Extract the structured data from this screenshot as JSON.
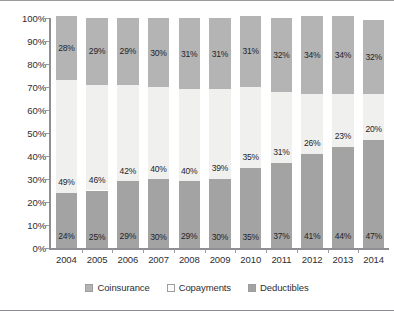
{
  "chart_data": {
    "type": "bar",
    "stacked": true,
    "stack_mode": "percent",
    "title": "",
    "subtitle": "",
    "xlabel": "",
    "ylabel": "",
    "grid": false,
    "legend_position": "bottom",
    "ylim": [
      0,
      100
    ],
    "categories": [
      "2004",
      "2005",
      "2006",
      "2007",
      "2008",
      "2009",
      "2010",
      "2011",
      "2012",
      "2013",
      "2014"
    ],
    "y_ticks": [
      "0%",
      "10%",
      "20%",
      "30%",
      "40%",
      "50%",
      "60%",
      "70%",
      "80%",
      "90%",
      "100%"
    ],
    "y_tick_values": [
      0,
      10,
      20,
      30,
      40,
      50,
      60,
      70,
      80,
      90,
      100
    ],
    "series": [
      {
        "name": "Deductibles",
        "color": "#a3a3a3",
        "stack_order": 0,
        "values": [
          24,
          25,
          29,
          30,
          29,
          30,
          35,
          37,
          41,
          44,
          47
        ],
        "labels": [
          "24%",
          "25%",
          "29%",
          "30%",
          "29%",
          "30%",
          "35%",
          "37%",
          "41%",
          "44%",
          "47%"
        ]
      },
      {
        "name": "Copayments",
        "color": "#f0f0ee",
        "stack_order": 1,
        "values": [
          49,
          46,
          42,
          40,
          40,
          39,
          35,
          31,
          26,
          23,
          20
        ],
        "labels": [
          "49%",
          "46%",
          "42%",
          "40%",
          "40%",
          "39%",
          "35%",
          "31%",
          "26%",
          "23%",
          "20%"
        ]
      },
      {
        "name": "Coinsurance",
        "color": "#b4b4b4",
        "stack_order": 2,
        "values": [
          28,
          29,
          29,
          30,
          31,
          31,
          31,
          32,
          34,
          34,
          32
        ],
        "labels": [
          "28%",
          "29%",
          "29%",
          "30%",
          "31%",
          "31%",
          "31%",
          "32%",
          "34%",
          "34%",
          "32%"
        ]
      }
    ],
    "legend": [
      {
        "label": "Coinsurance",
        "swatch": "coinsurance",
        "color": "#b4b4b4"
      },
      {
        "label": "Copayments",
        "swatch": "copayments",
        "color": "#fbfbfa"
      },
      {
        "label": "Deductibles",
        "swatch": "deductibles",
        "color": "#a3a3a3"
      }
    ]
  }
}
